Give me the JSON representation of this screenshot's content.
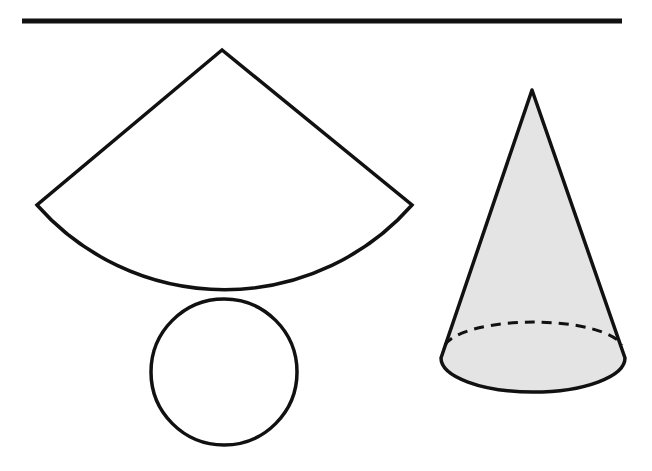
{
  "diagram": {
    "elements": [
      {
        "id": "top-rule",
        "type": "line"
      },
      {
        "id": "lateral-sector",
        "type": "sector",
        "label": "cone lateral surface (net)"
      },
      {
        "id": "base-circle",
        "type": "circle",
        "label": "cone base (net)"
      },
      {
        "id": "cone",
        "type": "cone",
        "label": "assembled cone",
        "fill": "#e6e6e6"
      }
    ],
    "colors": {
      "stroke": "#111111",
      "cone_fill": "#e4e4e4",
      "background": "#ffffff"
    }
  }
}
